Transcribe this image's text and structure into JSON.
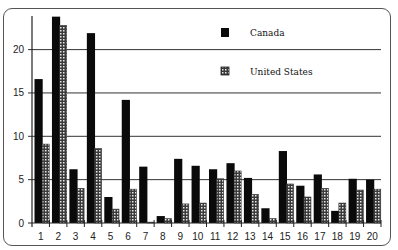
{
  "chart_data": {
    "type": "bar",
    "title": "",
    "xlabel": "",
    "ylabel": "",
    "ylim": [
      0,
      24
    ],
    "yticks": [
      0,
      5,
      10,
      15,
      20
    ],
    "grid": true,
    "legend_position": "upper-right-inside",
    "categories": [
      "1",
      "2",
      "3",
      "4",
      "5",
      "6",
      "7",
      "8",
      "9",
      "10",
      "11",
      "12",
      "13",
      "14",
      "15",
      "16",
      "17",
      "18",
      "19",
      "20"
    ],
    "series": [
      {
        "name": "Canada",
        "color": "#0a0a0a",
        "pattern": "solid",
        "values": [
          16.6,
          23.8,
          6.2,
          21.9,
          3.0,
          14.2,
          6.5,
          0.8,
          7.4,
          6.6,
          6.2,
          6.9,
          5.2,
          1.7,
          8.3,
          4.3,
          5.6,
          1.4,
          5.1,
          5.0
        ]
      },
      {
        "name": "United States",
        "color": "#888888",
        "pattern": "dotted",
        "values": [
          9.1,
          22.8,
          4.0,
          8.6,
          1.6,
          3.9,
          0.1,
          0.5,
          2.2,
          2.3,
          5.1,
          6.0,
          3.3,
          0.5,
          4.5,
          3.0,
          4.0,
          2.3,
          3.8,
          3.9
        ]
      }
    ]
  },
  "legend": {
    "items": [
      {
        "label": "Canada"
      },
      {
        "label": "United States"
      }
    ]
  }
}
